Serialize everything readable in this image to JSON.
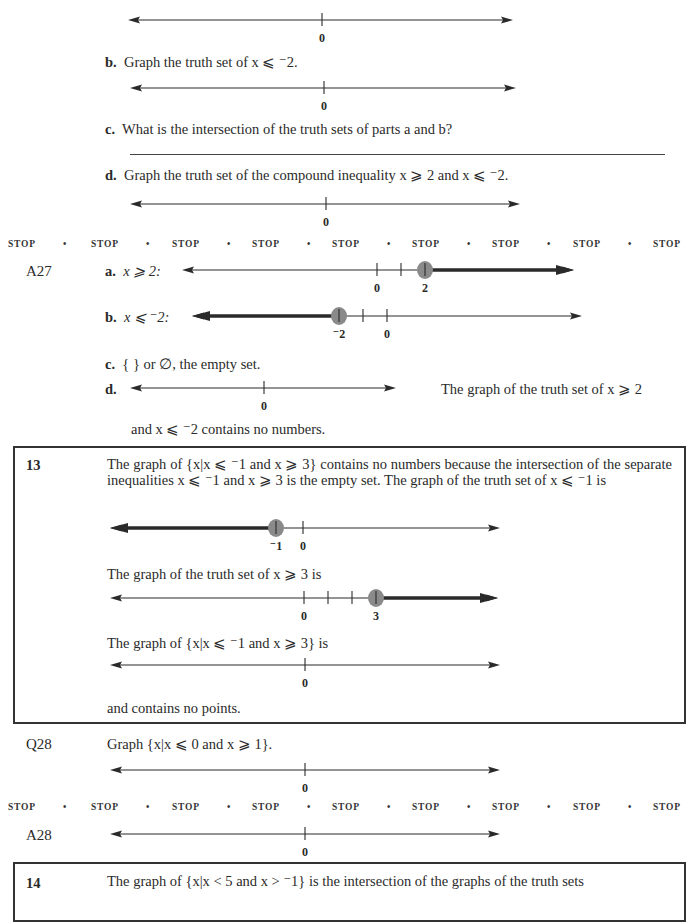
{
  "stop_rows": {
    "word": "STOP",
    "separator": "•",
    "count": 9
  },
  "q27_continued": {
    "part_b": {
      "label": "b.",
      "text": "Graph the truth set of x ⩽ ⁻2."
    },
    "part_c": {
      "label": "c.",
      "text": "What is the intersection of the truth sets of parts a and b?"
    },
    "part_d": {
      "label": "d.",
      "text": "Graph the truth set of the compound inequality x ⩾ 2 and x ⩽ ⁻2."
    }
  },
  "a27": {
    "label": "A27",
    "part_a": {
      "label": "a.",
      "text": "x ⩾ 2:"
    },
    "part_b": {
      "label": "b.",
      "text": "x ⩽ ⁻2:"
    },
    "part_c": {
      "label": "c.",
      "text": "{ } or ∅, the empty set."
    },
    "part_d": {
      "label": "d.",
      "note": "The graph of the truth set of x ⩾ 2",
      "note_cont": "and x ⩽ ⁻2 contains no numbers."
    }
  },
  "frame13": {
    "number": "13",
    "para1": "The graph of {x|x ⩽ ⁻1 and x ⩾ 3} contains no numbers because the intersection of the separate inequalities x ⩽ ⁻1 and x ⩾ 3 is the empty set. The graph of the truth set of x ⩽ ⁻1 is",
    "para2": "The graph of the truth set of x ⩾ 3 is",
    "para3": "The graph of {x|x ⩽ ⁻1 and x ⩾ 3} is",
    "para4": "and contains no points."
  },
  "q28": {
    "label": "Q28",
    "text": "Graph {x|x ⩽ 0 and x ⩾ 1}."
  },
  "a28": {
    "label": "A28"
  },
  "frame14": {
    "number": "14",
    "text": "The graph of {x|x < 5 and x > ⁻1} is the intersection of the graphs of the truth sets"
  },
  "number_lines": [
    {
      "id": "q27a-blank",
      "ticks": [
        0
      ],
      "labels": {
        "0": "0"
      },
      "shaded": null
    },
    {
      "id": "q27b-blank",
      "ticks": [
        0
      ],
      "labels": {
        "0": "0"
      },
      "shaded": null
    },
    {
      "id": "q27d-blank",
      "ticks": [
        0
      ],
      "labels": {
        "0": "0"
      },
      "shaded": null
    },
    {
      "id": "a27a",
      "ticks": [
        0,
        1,
        2
      ],
      "labels": {
        "0": "0",
        "2": "2"
      },
      "shaded": {
        "from": 2,
        "direction": "right",
        "closed": true
      }
    },
    {
      "id": "a27b",
      "ticks": [
        -2,
        -1,
        0
      ],
      "labels": {
        "-2": "⁻2",
        "0": "0"
      },
      "shaded": {
        "from": -2,
        "direction": "left",
        "closed": true
      }
    },
    {
      "id": "a27d",
      "ticks": [
        0
      ],
      "labels": {
        "0": "0"
      },
      "shaded": null
    },
    {
      "id": "f13-1",
      "ticks": [
        -1,
        0
      ],
      "labels": {
        "-1": "⁻1",
        "0": "0"
      },
      "shaded": {
        "from": -1,
        "direction": "left",
        "closed": true
      }
    },
    {
      "id": "f13-2",
      "ticks": [
        0,
        1,
        2,
        3
      ],
      "labels": {
        "0": "0",
        "3": "3"
      },
      "shaded": {
        "from": 3,
        "direction": "right",
        "closed": true
      }
    },
    {
      "id": "f13-3",
      "ticks": [
        0
      ],
      "labels": {
        "0": "0"
      },
      "shaded": null
    },
    {
      "id": "q28",
      "ticks": [
        0
      ],
      "labels": {
        "0": "0"
      },
      "shaded": null
    },
    {
      "id": "a28",
      "ticks": [
        0
      ],
      "labels": {
        "0": "0"
      },
      "shaded": null
    }
  ],
  "colors": {
    "ink": "#2a2a2a",
    "dot": "#8a8a8a"
  }
}
